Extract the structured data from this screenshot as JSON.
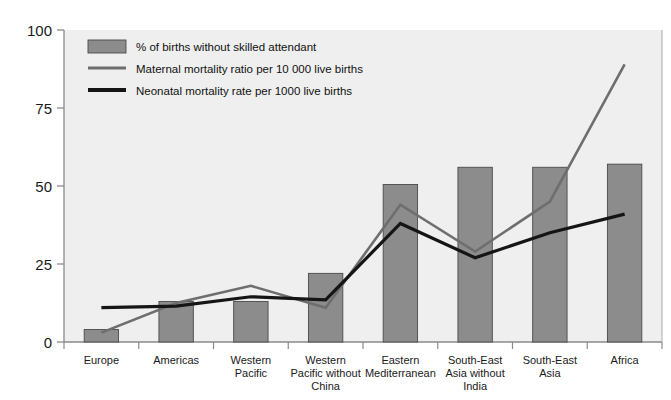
{
  "chart_data": {
    "type": "bar",
    "title": "",
    "subtitle": "",
    "xlabel": "",
    "ylabel": "",
    "ylim": [
      0,
      100
    ],
    "yticks": [
      0,
      25,
      50,
      75,
      100
    ],
    "ytick_labels": [
      "0",
      "25",
      "50",
      "75",
      "100"
    ],
    "grid": false,
    "legend_position": "top-left",
    "categories": [
      "Europe",
      "Americas",
      "Western Pacific",
      "Western Pacific without China",
      "Eastern Mediterranean",
      "South-East Asia without India",
      "South-East Asia",
      "Africa"
    ],
    "category_lines": [
      [
        "Europe"
      ],
      [
        "Americas"
      ],
      [
        "Western",
        "Pacific"
      ],
      [
        "Western",
        "Pacific without",
        "China"
      ],
      [
        "Eastern",
        "Mediterranean"
      ],
      [
        "South-East",
        "Asia without",
        "India"
      ],
      [
        "South-East",
        "Asia"
      ],
      [
        "Africa"
      ]
    ],
    "series": [
      {
        "name": "% of births without skilled attendant",
        "type": "bar",
        "color": "#8c8c8c",
        "values": [
          4,
          13,
          13,
          22,
          50.5,
          56,
          56,
          57
        ]
      },
      {
        "name": "Maternal mortality ratio per 10 000 live births",
        "type": "line",
        "color": "#6e6e6e",
        "values": [
          3,
          12.5,
          18,
          11,
          44,
          29,
          45,
          89
        ]
      },
      {
        "name": "Neonatal mortality rate per 1000 live births",
        "type": "line",
        "color": "#151515",
        "values": [
          11,
          11.5,
          14.5,
          13.5,
          38,
          27,
          35,
          41
        ]
      }
    ]
  },
  "legend": {
    "items": [
      {
        "label": "% of births without skilled attendant",
        "marker": "swatch",
        "color": "#8c8c8c"
      },
      {
        "label": "Maternal mortality ratio per 10 000 live births",
        "marker": "line",
        "color": "#6e6e6e"
      },
      {
        "label": "Neonatal mortality rate per 1000 live births",
        "marker": "line-thick",
        "color": "#151515"
      }
    ]
  },
  "plot": {
    "background_color": "#efefef",
    "axis_color": "#8a8a8a",
    "text_color": "#1a1a1a"
  }
}
